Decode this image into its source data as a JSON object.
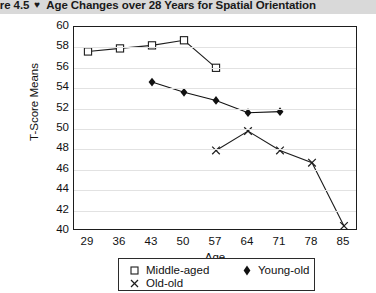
{
  "figure": {
    "caption_prefix": "gure 4.5",
    "caption_glyph": "♥",
    "caption_text": "Age Changes over 28 Years for Spatial Orientation"
  },
  "chart_data": {
    "type": "line",
    "title": "Age Changes over 28 Years for Spatial Orientation",
    "xlabel": "Age",
    "ylabel": "T-Score Means",
    "x": [
      29,
      36,
      43,
      50,
      57,
      64,
      71,
      78,
      85
    ],
    "xtick_labels": [
      "29",
      "36",
      "43",
      "50",
      "57",
      "64",
      "71",
      "78",
      "85"
    ],
    "ytick_labels": [
      "60",
      "58",
      "56",
      "54",
      "52",
      "50",
      "48",
      "46",
      "44",
      "42",
      "40"
    ],
    "yticks": [
      60,
      58,
      56,
      54,
      52,
      50,
      48,
      46,
      44,
      42,
      40
    ],
    "ylim": [
      40,
      60
    ],
    "xlim": [
      29,
      85
    ],
    "grid": true,
    "legend_position": "bottom",
    "series": [
      {
        "name": "Middle-aged",
        "marker": "open-square",
        "color": "#1d1d1d",
        "x": [
          29,
          36,
          43,
          50,
          57
        ],
        "values": [
          57.6,
          57.9,
          58.2,
          58.7,
          56.0
        ]
      },
      {
        "name": "Young-old",
        "marker": "filled-diamond",
        "color": "#111111",
        "x": [
          43,
          50,
          57,
          64,
          71
        ],
        "values": [
          54.6,
          53.6,
          52.8,
          51.6,
          51.7
        ]
      },
      {
        "name": "Old-old",
        "marker": "cross",
        "color": "#1d1d1d",
        "x": [
          57,
          64,
          71,
          78,
          85
        ],
        "values": [
          47.9,
          49.8,
          47.9,
          46.7,
          40.5
        ]
      }
    ]
  },
  "legend": {
    "items": [
      {
        "label": "Middle-aged",
        "marker": "open-square"
      },
      {
        "label": "Young-old",
        "marker": "filled-diamond"
      },
      {
        "label": "Old-old",
        "marker": "cross"
      }
    ]
  }
}
